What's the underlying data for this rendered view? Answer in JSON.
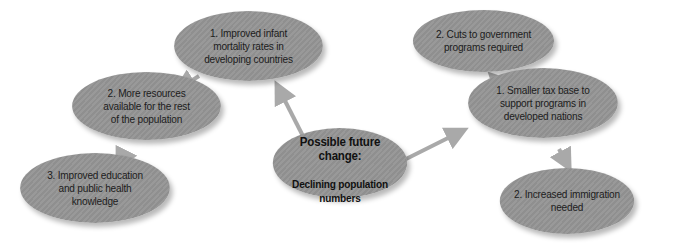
{
  "diagram": {
    "center": {
      "title": "Possible future change:",
      "subtitle": "Declining population\nnumbers"
    },
    "left_branch": [
      {
        "label": "1. Improved infant\nmortality rates in\ndeveloping countries"
      },
      {
        "label": "2. More resources\navailable for the rest\nof the population"
      },
      {
        "label": "3. Improved education\nand public health\nknowledge"
      }
    ],
    "right_branch": {
      "root": {
        "label": "1. Smaller tax base to\nsupport programs in\ndeveloped nations"
      },
      "children": [
        {
          "label": "2. Cuts to government\nprograms required"
        },
        {
          "label": "2. Increased immigration\nneeded"
        }
      ]
    },
    "colors": {
      "node_fill": "#949494",
      "arrow": "#a9a9a9",
      "text": "#1c1c1c",
      "background": "#ffffff"
    }
  }
}
